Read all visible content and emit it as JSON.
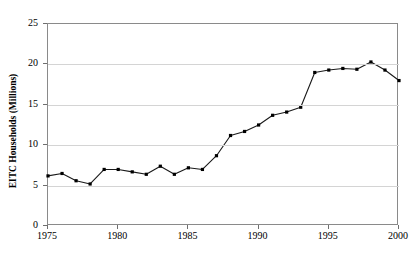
{
  "chart_data": {
    "type": "line",
    "title": "",
    "title_note": "chart title is cropped off the top edge of the screenshot and is not legible",
    "xlabel": "",
    "ylabel": "EITC Households (Millions)",
    "xlim": [
      1975,
      2000
    ],
    "ylim": [
      0,
      25
    ],
    "grid": true,
    "grid_axis": "y",
    "legend": false,
    "marker": "square",
    "line_color": "#1a1a1a",
    "marker_color": "#000000",
    "x": [
      1975,
      1976,
      1977,
      1978,
      1979,
      1980,
      1981,
      1982,
      1983,
      1984,
      1985,
      1986,
      1987,
      1988,
      1989,
      1990,
      1991,
      1992,
      1993,
      1994,
      1995,
      1996,
      1997,
      1998,
      1999,
      2000
    ],
    "values": [
      6.2,
      6.5,
      5.6,
      5.2,
      7.0,
      7.0,
      6.7,
      6.4,
      7.4,
      6.4,
      7.2,
      7.0,
      8.7,
      11.2,
      11.7,
      12.5,
      13.7,
      14.1,
      14.7,
      19.0,
      19.3,
      19.5,
      19.4,
      20.3,
      19.3,
      18.0
    ],
    "yticks": [
      0,
      5,
      10,
      15,
      20,
      25
    ],
    "xticks": [
      1975,
      1980,
      1985,
      1990,
      1995,
      2000
    ]
  }
}
